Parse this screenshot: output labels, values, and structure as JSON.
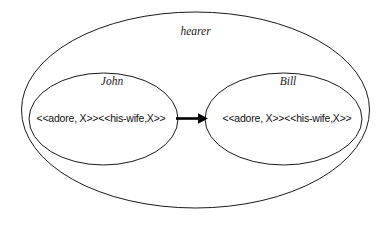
{
  "diagram": {
    "title_label": "hearer",
    "outer_set": {
      "name": "hearer",
      "label": "hearer"
    },
    "inner_sets": [
      {
        "name": "John",
        "label": "John",
        "formula": "<<adore, X>><<his-wife,X>>"
      },
      {
        "name": "Bill",
        "label": "Bill",
        "formula": "<<adore, X>><<his-wife,X>>"
      }
    ],
    "arrow": {
      "name": "john-to-bill-arrow",
      "direction": "right",
      "from": "John",
      "to": "Bill"
    },
    "colors": {
      "stroke": "#1a1a1a",
      "arrow": "#000000",
      "background": "#ffffff",
      "text": "#111111"
    }
  }
}
